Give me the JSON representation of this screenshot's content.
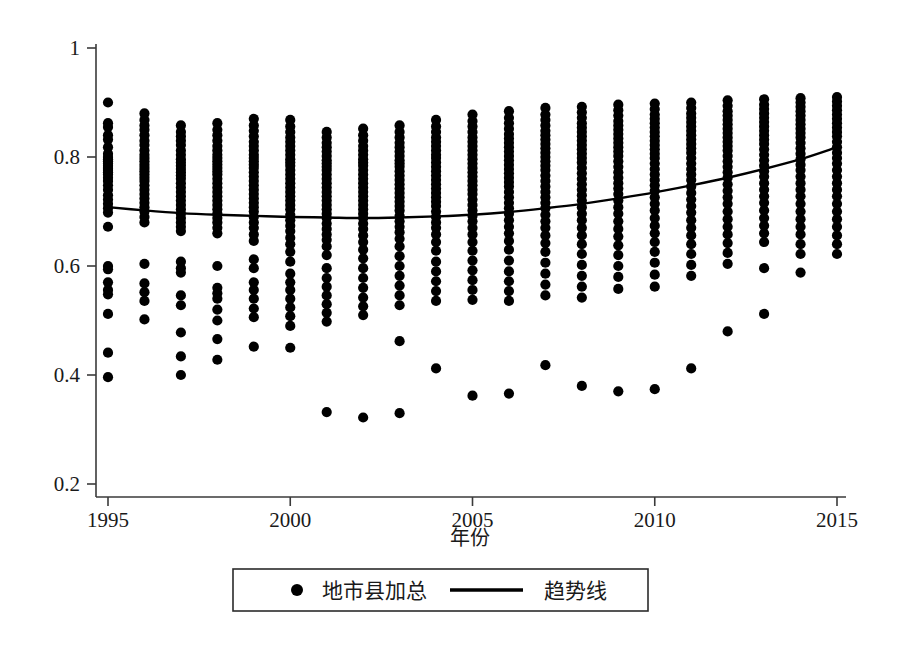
{
  "chart_data": {
    "type": "scatter",
    "title": "",
    "subtitle": "",
    "xlabel": "年份",
    "ylabel": "",
    "xlim": [
      1994.4,
      2015.6
    ],
    "ylim": [
      0.2,
      1.0
    ],
    "grid": false,
    "x_ticks": [
      "1995",
      "2000",
      "2005",
      "2010",
      "2015"
    ],
    "x_tick_values": [
      1995,
      2000,
      2005,
      2010,
      2015
    ],
    "y_ticks": [
      "0.2",
      "0.4",
      "0.6",
      "0.8",
      "1"
    ],
    "y_tick_values": [
      0.2,
      0.4,
      0.6,
      0.8,
      1.0
    ],
    "legend_position": "bottom",
    "series": [
      {
        "name": "地市县加总",
        "marker": "filled-circle",
        "color": "#000000",
        "type": "scatter",
        "points_by_year": {
          "1995": [
            0.9,
            0.862,
            0.855,
            0.84,
            0.832,
            0.818,
            0.806,
            0.8,
            0.796,
            0.792,
            0.788,
            0.784,
            0.78,
            0.776,
            0.772,
            0.768,
            0.762,
            0.756,
            0.748,
            0.74,
            0.73,
            0.722,
            0.714,
            0.706,
            0.698,
            0.672,
            0.6,
            0.594,
            0.57,
            0.556,
            0.548,
            0.512,
            0.441,
            0.396
          ],
          "1996": [
            0.88,
            0.868,
            0.858,
            0.85,
            0.84,
            0.83,
            0.822,
            0.812,
            0.804,
            0.798,
            0.792,
            0.786,
            0.78,
            0.774,
            0.768,
            0.762,
            0.756,
            0.748,
            0.74,
            0.732,
            0.724,
            0.716,
            0.708,
            0.7,
            0.69,
            0.68,
            0.604,
            0.568,
            0.552,
            0.536,
            0.502
          ],
          "1997": [
            0.858,
            0.846,
            0.838,
            0.83,
            0.822,
            0.812,
            0.804,
            0.796,
            0.79,
            0.784,
            0.778,
            0.772,
            0.766,
            0.76,
            0.752,
            0.744,
            0.736,
            0.728,
            0.72,
            0.712,
            0.704,
            0.696,
            0.688,
            0.68,
            0.672,
            0.664,
            0.608,
            0.596,
            0.588,
            0.546,
            0.528,
            0.478,
            0.434,
            0.4
          ],
          "1998": [
            0.862,
            0.85,
            0.84,
            0.83,
            0.82,
            0.812,
            0.804,
            0.798,
            0.792,
            0.786,
            0.78,
            0.774,
            0.768,
            0.76,
            0.752,
            0.744,
            0.736,
            0.728,
            0.72,
            0.712,
            0.704,
            0.696,
            0.688,
            0.68,
            0.67,
            0.66,
            0.6,
            0.56,
            0.55,
            0.54,
            0.52,
            0.5,
            0.466,
            0.428
          ],
          "1999": [
            0.87,
            0.858,
            0.848,
            0.838,
            0.828,
            0.82,
            0.812,
            0.804,
            0.798,
            0.792,
            0.786,
            0.78,
            0.772,
            0.764,
            0.756,
            0.748,
            0.74,
            0.732,
            0.724,
            0.716,
            0.708,
            0.7,
            0.69,
            0.68,
            0.67,
            0.658,
            0.646,
            0.612,
            0.596,
            0.57,
            0.556,
            0.54,
            0.522,
            0.506,
            0.452
          ],
          "2000": [
            0.868,
            0.856,
            0.846,
            0.836,
            0.828,
            0.82,
            0.812,
            0.804,
            0.796,
            0.79,
            0.784,
            0.776,
            0.768,
            0.76,
            0.752,
            0.744,
            0.736,
            0.728,
            0.72,
            0.712,
            0.704,
            0.694,
            0.684,
            0.674,
            0.664,
            0.652,
            0.64,
            0.626,
            0.608,
            0.586,
            0.57,
            0.556,
            0.54,
            0.524,
            0.508,
            0.49,
            0.45
          ],
          "2001": [
            0.846,
            0.836,
            0.826,
            0.818,
            0.81,
            0.802,
            0.794,
            0.788,
            0.782,
            0.776,
            0.768,
            0.76,
            0.752,
            0.744,
            0.736,
            0.728,
            0.72,
            0.712,
            0.704,
            0.696,
            0.688,
            0.678,
            0.668,
            0.658,
            0.648,
            0.636,
            0.62,
            0.596,
            0.578,
            0.562,
            0.546,
            0.53,
            0.514,
            0.498,
            0.332
          ],
          "2002": [
            0.852,
            0.84,
            0.83,
            0.82,
            0.812,
            0.804,
            0.796,
            0.79,
            0.784,
            0.776,
            0.768,
            0.76,
            0.752,
            0.744,
            0.736,
            0.728,
            0.72,
            0.712,
            0.704,
            0.696,
            0.688,
            0.678,
            0.668,
            0.656,
            0.644,
            0.63,
            0.614,
            0.596,
            0.578,
            0.56,
            0.542,
            0.526,
            0.51,
            0.322
          ],
          "2003": [
            0.858,
            0.846,
            0.836,
            0.826,
            0.818,
            0.81,
            0.802,
            0.794,
            0.788,
            0.782,
            0.774,
            0.766,
            0.758,
            0.75,
            0.742,
            0.734,
            0.726,
            0.718,
            0.71,
            0.702,
            0.692,
            0.682,
            0.672,
            0.662,
            0.65,
            0.636,
            0.618,
            0.6,
            0.582,
            0.564,
            0.546,
            0.528,
            0.462,
            0.33
          ],
          "2004": [
            0.868,
            0.856,
            0.846,
            0.836,
            0.828,
            0.82,
            0.812,
            0.804,
            0.798,
            0.79,
            0.782,
            0.774,
            0.766,
            0.758,
            0.75,
            0.742,
            0.734,
            0.726,
            0.718,
            0.71,
            0.7,
            0.69,
            0.68,
            0.67,
            0.658,
            0.644,
            0.628,
            0.608,
            0.59,
            0.572,
            0.554,
            0.536,
            0.412
          ],
          "2005": [
            0.878,
            0.866,
            0.856,
            0.846,
            0.836,
            0.828,
            0.82,
            0.812,
            0.804,
            0.796,
            0.788,
            0.78,
            0.772,
            0.764,
            0.756,
            0.748,
            0.74,
            0.732,
            0.722,
            0.712,
            0.702,
            0.692,
            0.682,
            0.67,
            0.658,
            0.644,
            0.628,
            0.61,
            0.592,
            0.574,
            0.556,
            0.538,
            0.362
          ],
          "2006": [
            0.884,
            0.872,
            0.862,
            0.852,
            0.842,
            0.834,
            0.826,
            0.818,
            0.81,
            0.802,
            0.794,
            0.786,
            0.778,
            0.77,
            0.762,
            0.754,
            0.746,
            0.736,
            0.726,
            0.716,
            0.706,
            0.696,
            0.684,
            0.672,
            0.66,
            0.646,
            0.63,
            0.61,
            0.59,
            0.572,
            0.554,
            0.536,
            0.366
          ],
          "2007": [
            0.89,
            0.878,
            0.868,
            0.858,
            0.848,
            0.84,
            0.832,
            0.824,
            0.816,
            0.808,
            0.8,
            0.792,
            0.784,
            0.776,
            0.766,
            0.756,
            0.746,
            0.736,
            0.726,
            0.716,
            0.706,
            0.694,
            0.682,
            0.67,
            0.656,
            0.642,
            0.626,
            0.606,
            0.586,
            0.566,
            0.546,
            0.418
          ],
          "2008": [
            0.892,
            0.882,
            0.872,
            0.862,
            0.854,
            0.846,
            0.838,
            0.83,
            0.822,
            0.814,
            0.806,
            0.798,
            0.79,
            0.78,
            0.77,
            0.76,
            0.75,
            0.74,
            0.73,
            0.72,
            0.708,
            0.696,
            0.684,
            0.67,
            0.656,
            0.64,
            0.622,
            0.602,
            0.582,
            0.562,
            0.542,
            0.38
          ],
          "2009": [
            0.896,
            0.886,
            0.876,
            0.866,
            0.858,
            0.85,
            0.842,
            0.834,
            0.826,
            0.818,
            0.81,
            0.802,
            0.792,
            0.782,
            0.772,
            0.762,
            0.752,
            0.742,
            0.732,
            0.72,
            0.708,
            0.696,
            0.682,
            0.668,
            0.654,
            0.638,
            0.62,
            0.6,
            0.58,
            0.558,
            0.37
          ],
          "2010": [
            0.898,
            0.888,
            0.878,
            0.87,
            0.862,
            0.854,
            0.846,
            0.838,
            0.83,
            0.822,
            0.814,
            0.806,
            0.798,
            0.788,
            0.778,
            0.768,
            0.758,
            0.748,
            0.738,
            0.726,
            0.714,
            0.702,
            0.688,
            0.674,
            0.66,
            0.644,
            0.626,
            0.606,
            0.584,
            0.562,
            0.374
          ],
          "2011": [
            0.9,
            0.89,
            0.88,
            0.872,
            0.864,
            0.856,
            0.848,
            0.84,
            0.832,
            0.824,
            0.816,
            0.808,
            0.798,
            0.788,
            0.778,
            0.768,
            0.758,
            0.746,
            0.734,
            0.722,
            0.71,
            0.698,
            0.684,
            0.67,
            0.656,
            0.64,
            0.622,
            0.602,
            0.582,
            0.412
          ],
          "2012": [
            0.904,
            0.894,
            0.884,
            0.876,
            0.868,
            0.86,
            0.852,
            0.844,
            0.836,
            0.828,
            0.82,
            0.812,
            0.802,
            0.792,
            0.782,
            0.772,
            0.762,
            0.75,
            0.738,
            0.726,
            0.714,
            0.7,
            0.686,
            0.672,
            0.658,
            0.642,
            0.624,
            0.604,
            0.48
          ],
          "2013": [
            0.906,
            0.896,
            0.888,
            0.88,
            0.872,
            0.864,
            0.856,
            0.848,
            0.84,
            0.832,
            0.824,
            0.814,
            0.804,
            0.794,
            0.784,
            0.774,
            0.764,
            0.752,
            0.74,
            0.728,
            0.716,
            0.702,
            0.688,
            0.674,
            0.66,
            0.644,
            0.596,
            0.512
          ],
          "2014": [
            0.908,
            0.9,
            0.892,
            0.884,
            0.876,
            0.868,
            0.86,
            0.852,
            0.844,
            0.836,
            0.826,
            0.816,
            0.806,
            0.796,
            0.786,
            0.776,
            0.764,
            0.752,
            0.74,
            0.728,
            0.714,
            0.7,
            0.686,
            0.672,
            0.658,
            0.64,
            0.622,
            0.588
          ],
          "2015": [
            0.91,
            0.902,
            0.894,
            0.886,
            0.878,
            0.87,
            0.862,
            0.854,
            0.846,
            0.838,
            0.828,
            0.818,
            0.808,
            0.798,
            0.788,
            0.776,
            0.764,
            0.752,
            0.74,
            0.728,
            0.714,
            0.7,
            0.686,
            0.672,
            0.656,
            0.64,
            0.622
          ]
        }
      },
      {
        "name": "趋势线",
        "marker": "line",
        "color": "#000000",
        "type": "line",
        "x": [
          1995,
          1996,
          1997,
          1998,
          1999,
          2000,
          2001,
          2002,
          2003,
          2004,
          2005,
          2006,
          2007,
          2008,
          2009,
          2010,
          2011,
          2012,
          2013,
          2014,
          2015
        ],
        "values": [
          0.708,
          0.702,
          0.697,
          0.694,
          0.692,
          0.69,
          0.689,
          0.688,
          0.689,
          0.691,
          0.694,
          0.699,
          0.706,
          0.714,
          0.724,
          0.735,
          0.748,
          0.762,
          0.778,
          0.796,
          0.818
        ]
      }
    ]
  },
  "axes": {
    "x_title": "年份",
    "x_tick_labels": [
      "1995",
      "2000",
      "2005",
      "2010",
      "2015"
    ],
    "y_tick_labels": [
      "0.2",
      "0.4",
      "0.6",
      "0.8",
      "1"
    ]
  },
  "legend": {
    "entries": [
      {
        "label": "地市县加总",
        "marker": "filled-circle"
      },
      {
        "label": "趋势线",
        "marker": "line"
      }
    ]
  },
  "colors": {
    "marker": "#000000",
    "trend": "#000000",
    "axis": "#3a3a3a",
    "background": "#ffffff"
  }
}
